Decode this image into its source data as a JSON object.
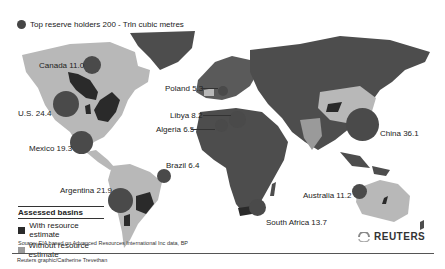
{
  "legend": {
    "bubble_label": "Top reserve holders 200 - Trln cubic metres",
    "basins_title": "Assessed basins",
    "basins": [
      {
        "label": "With resource estimate",
        "color": "#2a2a2a"
      },
      {
        "label": "Without resource estimate",
        "color": "#9a9a9a"
      }
    ]
  },
  "countries": [
    {
      "name": "Canada",
      "value": "11.0",
      "label": "Canada 11.0"
    },
    {
      "name": "U.S.",
      "value": "24.4",
      "label": "U.S. 24.4"
    },
    {
      "name": "Mexico",
      "value": "19.3",
      "label": "Mexico 19.3"
    },
    {
      "name": "Brazil",
      "value": "6.4",
      "label": "Brazil 6.4"
    },
    {
      "name": "Argentina",
      "value": "21.9",
      "label": "Argentina 21.9"
    },
    {
      "name": "Poland",
      "value": "5.3",
      "label": "Poland 5.3"
    },
    {
      "name": "Libya",
      "value": "8.2",
      "label": "Libya 8.2"
    },
    {
      "name": "Algeria",
      "value": "6.5",
      "label": "Algeria 6.5"
    },
    {
      "name": "South Africa",
      "value": "13.7",
      "label": "South Africa 13.7"
    },
    {
      "name": "China",
      "value": "36.1",
      "label": "China 36.1"
    },
    {
      "name": "Australia",
      "value": "11.2",
      "label": "Australia 11.2"
    }
  ],
  "footer": {
    "source": "Source: EIA based on Advanced Resources International Inc data, BP",
    "credit": "Reuters graphic/Catherine Trevethan",
    "brand": "REUTERS"
  },
  "colors": {
    "ocean": "#ffffff",
    "land_dark": "#4d4d4d",
    "land_light": "#b8b8b8",
    "bubble": "#454545"
  }
}
